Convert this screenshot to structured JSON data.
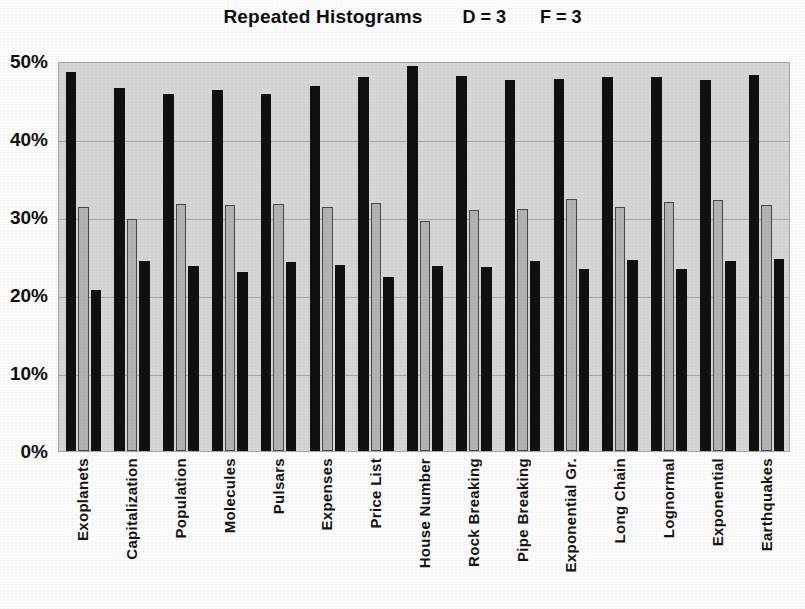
{
  "chart_data": {
    "type": "bar",
    "title": "Repeated Histograms",
    "annotations": [
      {
        "text": "D = 3"
      },
      {
        "text": "F = 3"
      }
    ],
    "xlabel": "",
    "ylabel": "",
    "ylim": [
      0,
      50
    ],
    "ytick_labels": [
      "50%",
      "40%",
      "30%",
      "20%",
      "10%",
      "0%"
    ],
    "ytick_values": [
      50,
      40,
      30,
      20,
      10,
      0
    ],
    "grid": true,
    "grid_axis": "y",
    "legend": "none",
    "plot_background": "#d9d9d9",
    "categories": [
      "Exoplanets",
      "Capitalization",
      "Population",
      "Molecules",
      "Pulsars",
      "Expenses",
      "Price List",
      "House Number",
      "Rock Breaking",
      "Pipe Breaking",
      "Exponential Gr.",
      "Long Chain",
      "Lognormal",
      "Exponential",
      "Earthquakes"
    ],
    "series": [
      {
        "name": "bar1",
        "color": "#111111",
        "values": [
          48.6,
          46.6,
          45.8,
          46.3,
          45.8,
          46.8,
          48.0,
          49.4,
          48.1,
          47.6,
          47.7,
          47.9,
          47.9,
          47.6,
          48.2
        ]
      },
      {
        "name": "bar2",
        "color": "#b5b5b5",
        "values": [
          31.3,
          29.7,
          31.7,
          31.5,
          31.7,
          31.3,
          31.8,
          29.5,
          30.9,
          31.0,
          32.3,
          31.3,
          31.9,
          32.2,
          31.5
        ]
      },
      {
        "name": "bar3",
        "color": "#111111",
        "values": [
          20.6,
          24.3,
          23.7,
          22.9,
          24.2,
          23.8,
          22.3,
          23.7,
          23.6,
          24.3,
          23.3,
          24.5,
          23.3,
          24.3,
          24.6
        ]
      }
    ]
  }
}
